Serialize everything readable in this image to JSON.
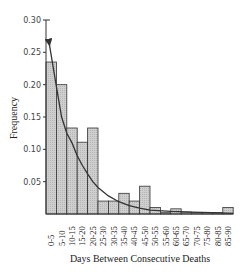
{
  "chart_data": {
    "type": "bar",
    "title": "",
    "xlabel": "Days Between Consecutive Deaths",
    "ylabel": "Frequency",
    "ylim": [
      0,
      0.3
    ],
    "yticks": [
      "0.05",
      "0.10",
      "0.15",
      "0.20",
      "0.25",
      "0.30"
    ],
    "ytick_values": [
      0.05,
      0.1,
      0.15,
      0.2,
      0.25,
      0.3
    ],
    "grid": false,
    "legend": null,
    "categories": [
      "0-5",
      "5-10",
      "10-15",
      "15-20",
      "20-25",
      "25-30",
      "30-35",
      "35-40",
      "40-45",
      "45-50",
      "50-55",
      "55-60",
      "60-65",
      "65-70",
      "70-75",
      "75-80",
      "80-85",
      "85-90"
    ],
    "values": [
      0.235,
      0.2,
      0.133,
      0.111,
      0.133,
      0.02,
      0.02,
      0.032,
      0.02,
      0.043,
      0.01,
      0.002,
      0.008,
      0.003,
      0.002,
      0.002,
      0.002,
      0.01
    ],
    "overlay": {
      "type": "line",
      "description": "fitted exponential decay curve with arrowhead at top",
      "points": [
        [
          1.5,
          0.265
        ],
        [
          5,
          0.197
        ],
        [
          7.5,
          0.15
        ],
        [
          10,
          0.125
        ],
        [
          12.5,
          0.11
        ],
        [
          15,
          0.09
        ],
        [
          17.5,
          0.075
        ],
        [
          20,
          0.062
        ],
        [
          22.5,
          0.05
        ],
        [
          25,
          0.041
        ],
        [
          30,
          0.028
        ],
        [
          35,
          0.019
        ],
        [
          40,
          0.013
        ],
        [
          45,
          0.009
        ],
        [
          50,
          0.006
        ],
        [
          60,
          0.004
        ],
        [
          70,
          0.003
        ],
        [
          80,
          0.002
        ],
        [
          90,
          0.001
        ]
      ]
    },
    "bar_color": "#c9c9c9",
    "bar_edge_color": "#333333",
    "line_color": "#333333"
  }
}
